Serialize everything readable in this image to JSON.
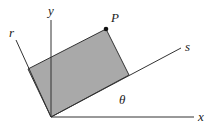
{
  "diagram": {
    "type": "rotated-coordinate-axes",
    "labels": {
      "x_axis": "x",
      "y_axis": "y",
      "r_axis": "r",
      "s_axis": "s",
      "point": "P",
      "angle": "θ"
    },
    "colors": {
      "rectangle_fill": "#a9a9a9",
      "stroke": "#333333",
      "background": "#ffffff"
    },
    "geometry": {
      "origin": [
        51,
        117
      ],
      "x_axis_end": [
        194,
        117
      ],
      "y_axis_end": [
        51,
        20
      ],
      "s_axis_end": [
        181,
        48
      ],
      "r_axis_end": [
        16,
        40
      ],
      "rectangle": [
        [
          51,
          117
        ],
        [
          129,
          75
        ],
        [
          106,
          29
        ],
        [
          28,
          69
        ]
      ],
      "point_P": [
        106,
        29
      ]
    }
  }
}
